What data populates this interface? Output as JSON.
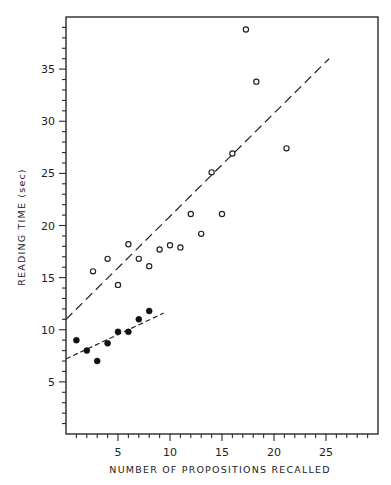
{
  "chart_data": {
    "type": "scatter",
    "title": "",
    "xlabel": "NUMBER OF PROPOSITIONS RECALLED",
    "ylabel": "READING TIME (sec)",
    "xlim": [
      0,
      30
    ],
    "ylim": [
      0,
      40
    ],
    "x_ticks": [
      5,
      10,
      15,
      20,
      25
    ],
    "y_ticks": [
      5,
      10,
      15,
      20,
      25,
      30,
      35
    ],
    "x_minor_tick_step": 1,
    "y_minor_tick_step": 1,
    "grid": false,
    "legend": null,
    "series": [
      {
        "name": "open circles",
        "marker": "open-circle",
        "points": [
          [
            2.6,
            15.6
          ],
          [
            4,
            16.8
          ],
          [
            5,
            14.3
          ],
          [
            6,
            18.2
          ],
          [
            7,
            16.8
          ],
          [
            8,
            16.1
          ],
          [
            9,
            17.7
          ],
          [
            10,
            18.1
          ],
          [
            11,
            17.9
          ],
          [
            12,
            21.1
          ],
          [
            13,
            19.2
          ],
          [
            14,
            25.1
          ],
          [
            15,
            21.1
          ],
          [
            16,
            26.9
          ],
          [
            17.3,
            38.8
          ],
          [
            18.3,
            33.8
          ],
          [
            21.2,
            27.4
          ]
        ],
        "fit_line": {
          "style": "long-dash",
          "from": [
            0,
            11.0
          ],
          "to": [
            25.3,
            36.0
          ]
        }
      },
      {
        "name": "filled circles",
        "marker": "filled-circle",
        "points": [
          [
            1,
            9.0
          ],
          [
            2,
            8.0
          ],
          [
            3,
            7.0
          ],
          [
            4,
            8.7
          ],
          [
            5,
            9.8
          ],
          [
            6,
            9.8
          ],
          [
            7,
            11.0
          ],
          [
            8,
            11.8
          ]
        ],
        "fit_line": {
          "style": "short-dash",
          "from": [
            0,
            7.2
          ],
          "to": [
            9.4,
            11.6
          ]
        }
      }
    ]
  }
}
